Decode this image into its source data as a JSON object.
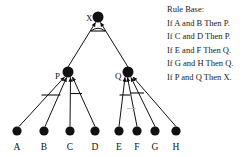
{
  "diagram": {
    "type": "and-or-inference-tree",
    "background_color": "#ffffff",
    "ink_color": "#111111",
    "root": {
      "id": "X",
      "label": "X",
      "x": 98,
      "y": 17,
      "r": 5.5
    },
    "internal_nodes": [
      {
        "id": "P",
        "label": "P",
        "x": 68,
        "y": 72,
        "r": 5.5
      },
      {
        "id": "Q",
        "label": "Q",
        "x": 128,
        "y": 72,
        "r": 5.5
      }
    ],
    "leaves": [
      {
        "id": "A",
        "label": "A",
        "x": 17,
        "y": 131,
        "r": 4.6
      },
      {
        "id": "B",
        "label": "B",
        "x": 44,
        "y": 131,
        "r": 4.6
      },
      {
        "id": "C",
        "label": "C",
        "x": 70,
        "y": 131,
        "r": 4.6
      },
      {
        "id": "D",
        "label": "D",
        "x": 95,
        "y": 131,
        "r": 4.6
      },
      {
        "id": "E",
        "label": "E",
        "x": 119,
        "y": 131,
        "r": 4.6
      },
      {
        "id": "F",
        "label": "F",
        "x": 137,
        "y": 131,
        "r": 4.6
      },
      {
        "id": "G",
        "label": "G",
        "x": 155,
        "y": 131,
        "r": 4.6
      },
      {
        "id": "H",
        "label": "H",
        "x": 176,
        "y": 131,
        "r": 4.6
      }
    ],
    "edges": [
      {
        "from": "P",
        "to": "X"
      },
      {
        "from": "Q",
        "to": "X"
      },
      {
        "from": "A",
        "to": "P"
      },
      {
        "from": "B",
        "to": "P"
      },
      {
        "from": "C",
        "to": "P"
      },
      {
        "from": "D",
        "to": "P"
      },
      {
        "from": "E",
        "to": "Q"
      },
      {
        "from": "F",
        "to": "Q"
      },
      {
        "from": "G",
        "to": "Q"
      },
      {
        "from": "H",
        "to": "Q"
      }
    ],
    "and_groups": [
      {
        "parent": "X",
        "children": [
          "P",
          "Q"
        ]
      },
      {
        "parent": "P",
        "children": [
          "A",
          "B"
        ]
      },
      {
        "parent": "P",
        "children": [
          "C",
          "D"
        ]
      },
      {
        "parent": "Q",
        "children": [
          "E",
          "F"
        ]
      },
      {
        "parent": "Q",
        "children": [
          "G",
          "H"
        ]
      }
    ]
  },
  "rule_base": {
    "title": "Rule Base:",
    "rules": [
      "If A and B Then P.",
      "If C and D Then P.",
      "If E and F Then Q.",
      "If G and H Then Q.",
      "If P and Q Then X."
    ]
  }
}
